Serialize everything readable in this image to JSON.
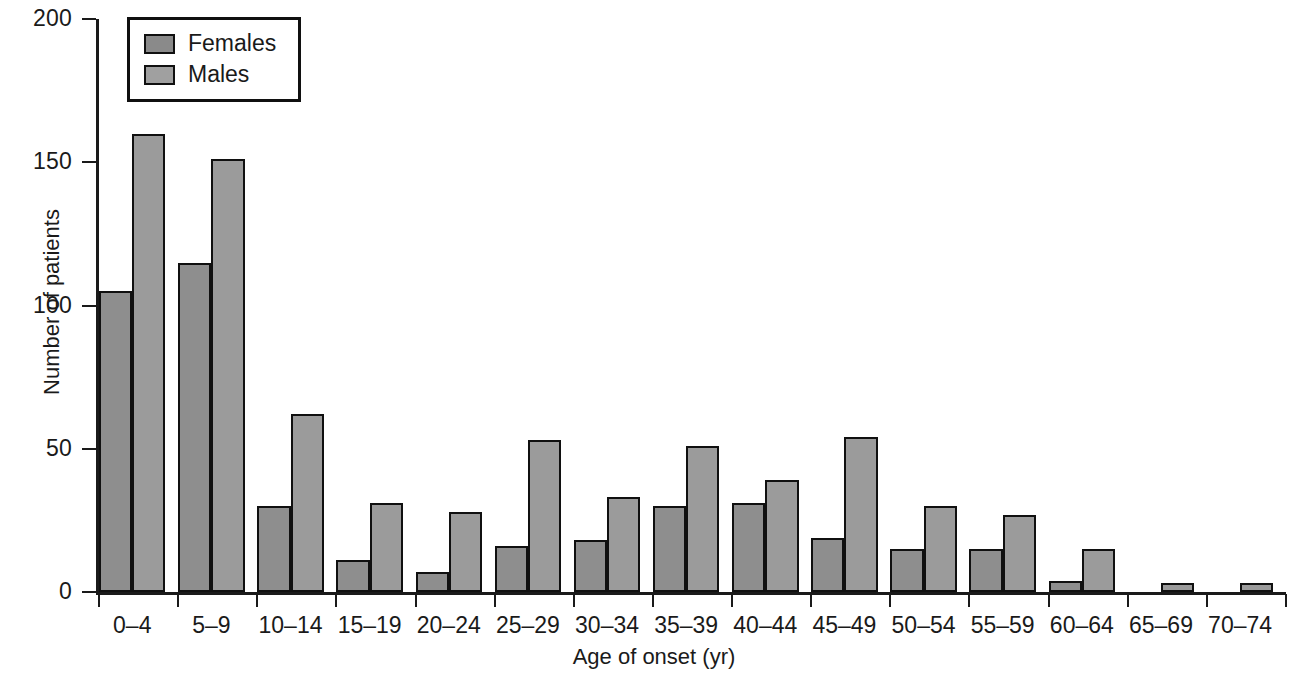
{
  "chart_data": {
    "type": "bar",
    "title": "",
    "xlabel": "Age of onset (yr)",
    "ylabel": "Number of patients",
    "categories": [
      "0–4",
      "5–9",
      "10–14",
      "15–19",
      "20–24",
      "25–29",
      "30–34",
      "35–39",
      "40–44",
      "45–49",
      "50–54",
      "55–59",
      "60–64",
      "65–69",
      "70–74"
    ],
    "series": [
      {
        "name": "Females",
        "color": "#8e8e8e",
        "values": [
          105,
          115,
          30,
          11,
          7,
          16,
          18,
          30,
          31,
          19,
          15,
          15,
          4,
          0,
          0
        ]
      },
      {
        "name": "Males",
        "color": "#9b9b9b",
        "values": [
          160,
          151,
          62,
          31,
          28,
          53,
          33,
          51,
          39,
          54,
          30,
          27,
          15,
          3,
          3
        ]
      }
    ],
    "ylim": [
      0,
      200
    ],
    "yticks": [
      0,
      50,
      100,
      150,
      200
    ],
    "ytick_labels": [
      "0",
      "50",
      "100",
      "150",
      "200"
    ],
    "grid": false,
    "legend_position": "top-left"
  },
  "legend": {
    "entries": [
      {
        "label": "Females"
      },
      {
        "label": "Males"
      }
    ]
  }
}
